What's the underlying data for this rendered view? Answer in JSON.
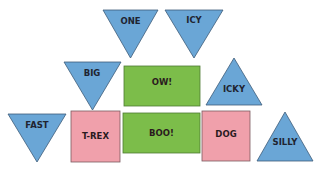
{
  "colors": {
    "triangle_fill": "#6aa6d6",
    "triangle_stroke": "#3e5c78",
    "green_fill": "#7cbd4a",
    "green_stroke": "#4e7a34",
    "pink_fill": "#f0a0ab",
    "pink_stroke": "#7a5a60",
    "text": "#1f2430"
  },
  "shapes": [
    {
      "label": "ONE",
      "type": "triangle-down",
      "color": "blue"
    },
    {
      "label": "ICY",
      "type": "triangle-down",
      "color": "blue"
    },
    {
      "label": "BIG",
      "type": "triangle-down",
      "color": "blue"
    },
    {
      "label": "OW!",
      "type": "rectangle",
      "color": "green"
    },
    {
      "label": "ICKY",
      "type": "triangle-up",
      "color": "blue"
    },
    {
      "label": "FAST",
      "type": "triangle-down",
      "color": "blue"
    },
    {
      "label": "T-REX",
      "type": "square",
      "color": "pink"
    },
    {
      "label": "BOO!",
      "type": "rectangle",
      "color": "green"
    },
    {
      "label": "DOG",
      "type": "square",
      "color": "pink"
    },
    {
      "label": "SILLY",
      "type": "triangle-up",
      "color": "blue"
    }
  ]
}
